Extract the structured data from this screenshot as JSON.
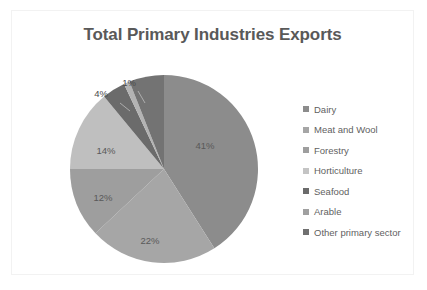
{
  "chart_data": {
    "type": "pie",
    "title": "Total Primary Industries Exports",
    "categories": [
      "Dairy",
      "Meat and Wool",
      "Forestry",
      "Horticulture",
      "Seafood",
      "Arable",
      "Other primary sector"
    ],
    "values": [
      41,
      22,
      12,
      14,
      4,
      1,
      6
    ],
    "value_labels": [
      "41%",
      "22%",
      "12%",
      "14%",
      "4%",
      "1%",
      ""
    ],
    "colors": [
      "#8c8c8c",
      "#a6a6a6",
      "#9e9e9e",
      "#bfbfbf",
      "#6b6b6b",
      "#b3b3b3",
      "#737373"
    ],
    "units": "percent",
    "legend_position": "right",
    "grid": false,
    "start_angle_deg": 0,
    "direction": "clockwise",
    "labels_shown": [
      "41%",
      "22%",
      "12%",
      "14%",
      "4%",
      "1%"
    ]
  },
  "chart": {
    "title": "Total Primary Industries Exports",
    "frame_color": "#f2f2f2",
    "title_color": "#595959",
    "background": "#ffffff"
  },
  "pie": {
    "slices": [
      {
        "label": "Dairy",
        "percent_text": "41%",
        "color": "#8c8c8c",
        "value": 41,
        "label_x": 137,
        "label_y": 72,
        "label_outside": false
      },
      {
        "label": "Meat and Wool",
        "percent_text": "22%",
        "color": "#a6a6a6",
        "value": 22,
        "label_x": 82,
        "label_y": 167,
        "label_outside": false
      },
      {
        "label": "Forestry",
        "percent_text": "12%",
        "color": "#9e9e9e",
        "value": 12,
        "label_x": 35,
        "label_y": 124,
        "label_outside": false
      },
      {
        "label": "Horticulture",
        "percent_text": "14%",
        "color": "#bfbfbf",
        "value": 14,
        "label_x": 38,
        "label_y": 77,
        "label_outside": false
      },
      {
        "label": "Seafood",
        "percent_text": "4%",
        "color": "#6b6b6b",
        "value": 4,
        "label_x": 33,
        "label_y": 20,
        "label_outside": true
      },
      {
        "label": "Arable",
        "percent_text": "1%",
        "color": "#b3b3b3",
        "value": 1,
        "label_x": 61,
        "label_y": 9,
        "label_outside": true
      },
      {
        "label": "Other primary sector",
        "percent_text": "",
        "color": "#737373",
        "value": 6,
        "label_x": 0,
        "label_y": 0,
        "label_outside": false
      }
    ]
  },
  "legend": {
    "items": [
      {
        "label": "Dairy",
        "color": "#8c8c8c"
      },
      {
        "label": "Meat and Wool",
        "color": "#a6a6a6"
      },
      {
        "label": "Forestry",
        "color": "#9e9e9e"
      },
      {
        "label": "Horticulture",
        "color": "#c4c4c4"
      },
      {
        "label": "Seafood",
        "color": "#6b6b6b"
      },
      {
        "label": "Arable",
        "color": "#a0a0a0"
      },
      {
        "label": "Other primary sector",
        "color": "#707070"
      }
    ]
  }
}
